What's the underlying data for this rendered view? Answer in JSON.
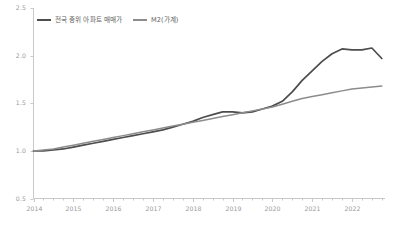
{
  "chart_data": {
    "type": "line",
    "title": "",
    "subtitle": "",
    "xlabel": "",
    "ylabel": "",
    "xlim": [
      2014.0,
      2022.83
    ],
    "ylim": [
      0.5,
      2.5
    ],
    "yticks": [
      "0.5",
      "1.0",
      "1.5",
      "2.0",
      "2.5"
    ],
    "ytick_values": [
      0.5,
      1.0,
      1.5,
      2.0,
      2.5
    ],
    "xticks": [
      "2014",
      "2015",
      "2016",
      "2017",
      "2018",
      "2019",
      "2020",
      "2021",
      "2022"
    ],
    "xtick_values": [
      2014,
      2015,
      2016,
      2017,
      2018,
      2019,
      2020,
      2021,
      2022
    ],
    "minor_ticks_per_year": 4,
    "grid": false,
    "legend_position": "top-left",
    "series": [
      {
        "name": "전국 중위 아파트 매매가",
        "color": "#4d4d4d",
        "x": [
          2014.0,
          2014.25,
          2014.5,
          2014.75,
          2015.0,
          2015.25,
          2015.5,
          2015.75,
          2016.0,
          2016.25,
          2016.5,
          2016.75,
          2017.0,
          2017.25,
          2017.5,
          2017.75,
          2018.0,
          2018.25,
          2018.5,
          2018.75,
          2019.0,
          2019.25,
          2019.5,
          2019.75,
          2020.0,
          2020.25,
          2020.5,
          2020.75,
          2021.0,
          2021.25,
          2021.5,
          2021.75,
          2022.0,
          2022.25,
          2022.5,
          2022.75
        ],
        "values": [
          1.0,
          1.0,
          1.01,
          1.02,
          1.04,
          1.06,
          1.08,
          1.1,
          1.12,
          1.14,
          1.16,
          1.18,
          1.2,
          1.22,
          1.25,
          1.28,
          1.31,
          1.35,
          1.38,
          1.41,
          1.41,
          1.4,
          1.41,
          1.44,
          1.47,
          1.52,
          1.62,
          1.74,
          1.84,
          1.94,
          2.02,
          2.07,
          2.06,
          2.06,
          2.08,
          1.97
        ]
      },
      {
        "name": "M2(가계)",
        "color": "#8c8c8c",
        "x": [
          2014.0,
          2014.25,
          2014.5,
          2014.75,
          2015.0,
          2015.25,
          2015.5,
          2015.75,
          2016.0,
          2016.25,
          2016.5,
          2016.75,
          2017.0,
          2017.25,
          2017.5,
          2017.75,
          2018.0,
          2018.25,
          2018.5,
          2018.75,
          2019.0,
          2019.25,
          2019.5,
          2019.75,
          2020.0,
          2020.25,
          2020.5,
          2020.75,
          2021.0,
          2021.25,
          2021.5,
          2021.75,
          2022.0,
          2022.25,
          2022.5,
          2022.75
        ],
        "values": [
          1.0,
          1.01,
          1.02,
          1.04,
          1.06,
          1.08,
          1.1,
          1.12,
          1.14,
          1.16,
          1.18,
          1.2,
          1.22,
          1.24,
          1.26,
          1.28,
          1.3,
          1.32,
          1.34,
          1.36,
          1.38,
          1.4,
          1.42,
          1.44,
          1.46,
          1.49,
          1.52,
          1.55,
          1.57,
          1.59,
          1.61,
          1.63,
          1.65,
          1.66,
          1.67,
          1.68
        ]
      }
    ]
  },
  "legend": {
    "items": [
      {
        "label": "전국 중위 아파트 매매가",
        "color": "#4d4d4d"
      },
      {
        "label": "M2(가계)",
        "color": "#8c8c8c"
      }
    ]
  },
  "axis": {
    "axis_color": "#c9c9c9",
    "tick_color": "#c9c9c9",
    "label_color": "#9a9a9a"
  }
}
